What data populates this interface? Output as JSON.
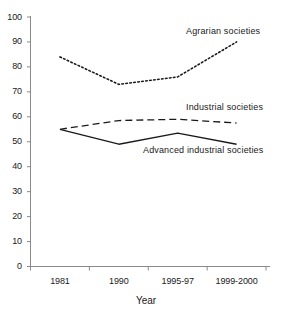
{
  "chart_data": {
    "type": "line",
    "title": "",
    "xlabel": "Year",
    "ylabel": "",
    "categories": [
      "1981",
      "1990",
      "1995-97",
      "1999-2000"
    ],
    "ylim": [
      0,
      100
    ],
    "ytick_values": [
      100,
      90,
      80,
      70,
      60,
      50,
      40,
      30,
      20,
      10,
      0
    ],
    "grid": false,
    "legend_position": "inline-annotations",
    "series": [
      {
        "name": "Agrarian societies",
        "style": "dotted",
        "color": "#1a1a1a",
        "values": [
          84,
          73,
          76,
          90
        ]
      },
      {
        "name": "Industrial societies",
        "style": "dashed",
        "color": "#1a1a1a",
        "values": [
          55,
          58.5,
          59,
          57.5
        ]
      },
      {
        "name": "Advanced industrial societies",
        "style": "solid",
        "color": "#1a1a1a",
        "values": [
          55,
          49,
          53.5,
          49
        ]
      }
    ]
  },
  "axes": {
    "y_labels": [
      "100",
      "90",
      "80",
      "70",
      "60",
      "50",
      "40",
      "30",
      "20",
      "10",
      "0"
    ],
    "x_labels": [
      "1981",
      "1990",
      "1995-97",
      "1999-2000"
    ],
    "x_axis_title": "Year",
    "axis_color": "#8a8a8a"
  },
  "annotations": {
    "agrarian": "Agrarian societies",
    "industrial": "Industrial societies",
    "advanced": "Advanced industrial societies"
  }
}
